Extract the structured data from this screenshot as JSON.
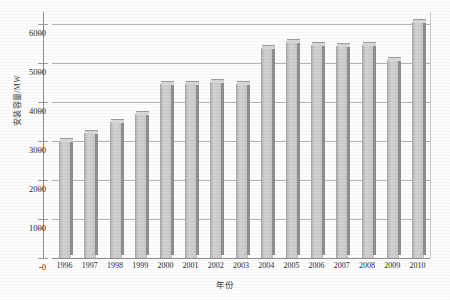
{
  "chart_data": {
    "type": "bar",
    "title": "",
    "xlabel": "年份",
    "ylabel": "安装容量/MW",
    "categories": [
      "1996",
      "1997",
      "1998",
      "1999",
      "2000",
      "2001",
      "2002",
      "2003",
      "2004",
      "2005",
      "2006",
      "2007",
      "2008",
      "2009",
      "2010"
    ],
    "values": [
      3000,
      3210,
      3480,
      3680,
      4450,
      4460,
      4500,
      4460,
      5380,
      5520,
      5460,
      5430,
      5450,
      5080,
      6050
    ],
    "ylim": [
      0,
      6300
    ],
    "yticks": [
      0,
      1000,
      2000,
      3000,
      4000,
      5000,
      6000
    ],
    "ytick_labels": [
      "0",
      "1000",
      "2000",
      "3000",
      "4000",
      "5000",
      "6000"
    ],
    "grid": true,
    "legend": false,
    "legend_position": "none",
    "series": [
      {
        "name": "安装容量",
        "values": [
          3000,
          3210,
          3480,
          3680,
          4450,
          4460,
          4500,
          4460,
          5380,
          5520,
          5460,
          5430,
          5450,
          5080,
          6050
        ]
      }
    ],
    "bar_color": "#cecece",
    "bar_side_color": "#8f8f8f",
    "grid_color": "#b4b4b4",
    "axis_color": "#8e8e8e",
    "text_color": "#2b2b2b"
  }
}
